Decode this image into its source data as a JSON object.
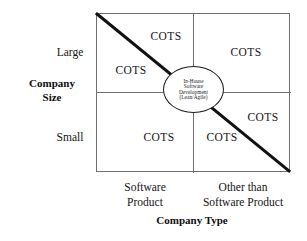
{
  "figure": {
    "kind": "quadrant-matrix-diagram",
    "y_axis": {
      "title_line1": "Company",
      "title_line2": "Size",
      "ticks": [
        "Large",
        "Small"
      ]
    },
    "x_axis": {
      "title": "Company Type",
      "categories": [
        {
          "line1": "Software",
          "line2": "Product"
        },
        {
          "line1": "Other than",
          "line2": "Software Product"
        }
      ]
    },
    "center_node": {
      "line1": "In-House",
      "line2": "Software",
      "line3": "Development",
      "line4": "(Lean/Agile)"
    },
    "cell_labels": [
      {
        "id": "top-left-upper",
        "text": "COTS"
      },
      {
        "id": "top-left-lower",
        "text": "COTS"
      },
      {
        "id": "top-right",
        "text": "COTS"
      },
      {
        "id": "bottom-left",
        "text": "COTS"
      },
      {
        "id": "bottom-right-inner",
        "text": "COTS"
      },
      {
        "id": "bottom-right-upper",
        "text": "COTS"
      }
    ],
    "colors": {
      "frame": "#6f6f6f",
      "diagonal": "#111111",
      "node_outline": "#1a1a1a",
      "text": "#141414",
      "background": "#ffffff"
    }
  }
}
